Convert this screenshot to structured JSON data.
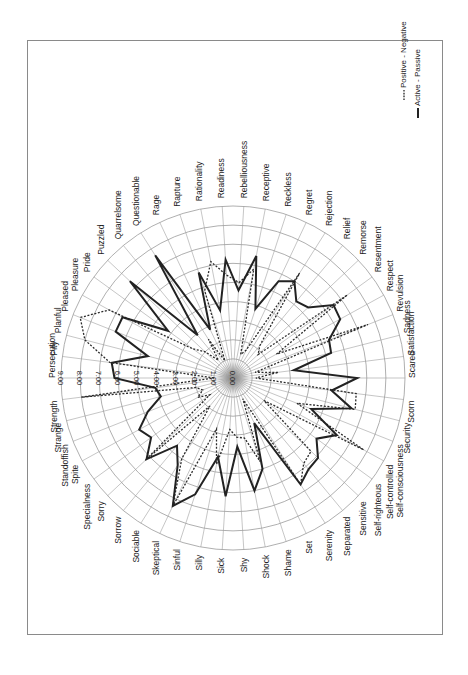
{
  "chart_data": {
    "type": "radar",
    "title": "",
    "orientation_note": "figure rotated 90 degrees clockwise on page",
    "radial_ticks": [
      "0.00",
      "1.00",
      "2.00",
      "3.00",
      "4.00",
      "5.00",
      "6.00",
      "7.00",
      "8.00",
      "9.00"
    ],
    "rmax": 9,
    "legend": [
      {
        "name": "Positive - Negative",
        "style": "dotted"
      },
      {
        "name": "Active - Passive",
        "style": "solid"
      }
    ],
    "categories": [
      "Persecution",
      "Pity",
      "Planful",
      "Pleased",
      "Pleasure",
      "Pride",
      "Puzzled",
      "Quarrelsome",
      "Questionable",
      "Rage",
      "Rapture",
      "Rationality",
      "Readiness",
      "Rebelliousness",
      "Receptive",
      "Reckless",
      "Regret",
      "Rejection",
      "Relief",
      "Remorse",
      "Resentment",
      "Respect",
      "Revulsion",
      "Sadness",
      "Satisfaction",
      "Scared",
      "Scorn",
      "Security",
      "Self-consciousness",
      "Self-controlled",
      "Self-righteous",
      "Sensitive",
      "Separated",
      "Serenity",
      "Set",
      "Shame",
      "Shock",
      "Shy",
      "Sick",
      "Silly",
      "Sinful",
      "Skeptical",
      "Sociable",
      "Sorrow",
      "Sorry",
      "Specialness",
      "Spite",
      "Standoffish",
      "Strange",
      "Strength"
    ],
    "series": [
      {
        "name": "Positive - Negative",
        "values": [
          1.0,
          6.5,
          8.0,
          8.6,
          7.4,
          2.6,
          2.0,
          1.2,
          2.4,
          1.0,
          4.8,
          6.2,
          5.4,
          5.0,
          5.8,
          1.3,
          1.6,
          6.5,
          2.2,
          1.8,
          7.4,
          2.6,
          7.6,
          1.2,
          2.4,
          1.2,
          6.5,
          6.6,
          3.6,
          7.8,
          2.0,
          5.6,
          5.8,
          6.6,
          1.2,
          4.6,
          3.2,
          3.1,
          2.7,
          4.6,
          2.8,
          7.4,
          5.0,
          1.9,
          6.3,
          1.5,
          2.1,
          1.7,
          2.0,
          8.0
        ]
      },
      {
        "name": "Active - Passive",
        "values": [
          6.2,
          6.4,
          4.6,
          6.6,
          6.6,
          4.2,
          7.4,
          2.9,
          7.6,
          2.8,
          5.8,
          3.6,
          6.2,
          4.6,
          6.5,
          3.8,
          5.6,
          6.0,
          5.2,
          5.4,
          6.5,
          6.4,
          5.4,
          5.3,
          3.2,
          6.5,
          5.2,
          6.4,
          4.4,
          6.2,
          5.4,
          6.1,
          6.2,
          6.6,
          2.6,
          5.0,
          6.0,
          3.6,
          6.2,
          4.2,
          6.4,
          7.4,
          5.4,
          4.6,
          6.2,
          5.3,
          5.6,
          4.8,
          3.9,
          4.1
        ]
      }
    ]
  }
}
